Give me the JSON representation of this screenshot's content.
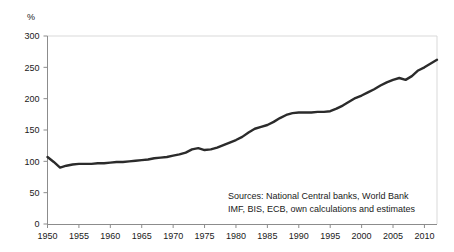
{
  "chart_data": {
    "type": "line",
    "title": "",
    "subtitle": "",
    "xlabel": "",
    "ylabel": "%",
    "unit_label": "%",
    "xlim": [
      1950,
      2012
    ],
    "ylim": [
      0,
      300
    ],
    "grid": false,
    "legend": null,
    "y_ticks": [
      0,
      50,
      100,
      150,
      200,
      250,
      300
    ],
    "y_tick_labels": [
      "0",
      "50",
      "100",
      "150",
      "200",
      "250",
      "300"
    ],
    "x_ticks": [
      1950,
      1955,
      1960,
      1965,
      1970,
      1975,
      1980,
      1985,
      1990,
      1995,
      2000,
      2005,
      2010
    ],
    "x_tick_labels": [
      "1950",
      "1955",
      "1960",
      "1965",
      "1970",
      "1975",
      "1980",
      "1985",
      "1990",
      "1995",
      "2000",
      "2005",
      "2010"
    ],
    "line_color": "#2b2b2b",
    "line_width": 2.4,
    "series": [
      {
        "name": "Global debt to GDP",
        "x": [
          1950,
          1951,
          1952,
          1953,
          1954,
          1955,
          1956,
          1957,
          1958,
          1959,
          1960,
          1961,
          1962,
          1963,
          1964,
          1965,
          1966,
          1967,
          1968,
          1969,
          1970,
          1971,
          1972,
          1973,
          1974,
          1975,
          1976,
          1977,
          1978,
          1979,
          1980,
          1981,
          1982,
          1983,
          1984,
          1985,
          1986,
          1987,
          1988,
          1989,
          1990,
          1991,
          1992,
          1993,
          1994,
          1995,
          1996,
          1997,
          1998,
          1999,
          2000,
          2001,
          2002,
          2003,
          2004,
          2005,
          2006,
          2007,
          2008,
          2009,
          2010,
          2011,
          2012
        ],
        "values": [
          107,
          99,
          90,
          93,
          95,
          96,
          96,
          96,
          97,
          97,
          98,
          99,
          99,
          100,
          101,
          102,
          103,
          105,
          106,
          107,
          109,
          111,
          114,
          119,
          121,
          118,
          119,
          122,
          126,
          130,
          134,
          139,
          146,
          152,
          155,
          158,
          163,
          169,
          174,
          177,
          178,
          178,
          178,
          179,
          179,
          180,
          184,
          189,
          195,
          201,
          205,
          210,
          215,
          221,
          226,
          230,
          233,
          230,
          236,
          245,
          250,
          256,
          262
        ]
      }
    ],
    "annotations": [
      {
        "name": "sources-note",
        "lines": [
          "Sources: National  Central banks, World Bank",
          "IMF, BIS, ECB, own calculations and estimates"
        ]
      }
    ]
  }
}
